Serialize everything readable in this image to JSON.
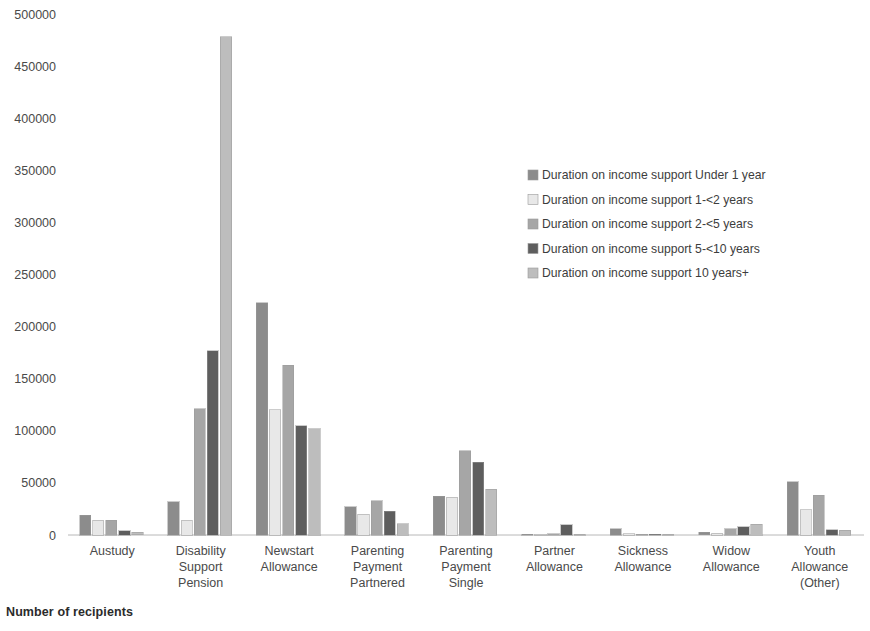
{
  "caption": "Number of recipients",
  "legend": {
    "position": "top-right",
    "items": [
      {
        "label": "Duration on income support Under 1 year",
        "color": "#8c8c8c"
      },
      {
        "label": "Duration on income support 1-<2 years",
        "color": "#e8e8e8"
      },
      {
        "label": "Duration on income support 2-<5 years",
        "color": "#a6a6a6"
      },
      {
        "label": "Duration on income support 5-<10 years",
        "color": "#5e5e5e"
      },
      {
        "label": "Duration on income support 10 years+",
        "color": "#bdbdbd"
      }
    ]
  },
  "chart_data": {
    "type": "bar",
    "title": "",
    "xlabel": "",
    "ylabel": "Number of recipients",
    "ylim": [
      0,
      500000
    ],
    "ytick_step": 50000,
    "yticks": [
      "0",
      "50000",
      "100000",
      "150000",
      "200000",
      "250000",
      "300000",
      "350000",
      "400000",
      "450000",
      "500000"
    ],
    "grid": false,
    "categories": [
      "Austudy",
      "Disability Support Pension",
      "Newstart Allowance",
      "Parenting Payment Partnered",
      "Parenting Payment Single",
      "Partner Allowance",
      "Sickness Allowance",
      "Widow Allowance",
      "Youth Allowance (Other)"
    ],
    "category_label_lines": [
      [
        "Austudy"
      ],
      [
        "Disability",
        "Support",
        "Pension"
      ],
      [
        "Newstart",
        "Allowance"
      ],
      [
        "Parenting",
        "Payment",
        "Partnered"
      ],
      [
        "Parenting",
        "Payment",
        "Single"
      ],
      [
        "Partner",
        "Allowance"
      ],
      [
        "Sickness",
        "Allowance"
      ],
      [
        "Widow",
        "Allowance"
      ],
      [
        "Youth",
        "Allowance",
        "(Other)"
      ]
    ],
    "series": [
      {
        "name": "Duration on income support Under 1 year",
        "color": "#8c8c8c",
        "values": [
          19000,
          32000,
          223000,
          27000,
          37000,
          200,
          6000,
          2500,
          51000
        ]
      },
      {
        "name": "Duration on income support 1-<2 years",
        "color": "#e8e8e8",
        "values": [
          14000,
          14000,
          120000,
          20000,
          36000,
          300,
          1000,
          1500,
          24000
        ]
      },
      {
        "name": "Duration on income support 2-<5 years",
        "color": "#a6a6a6",
        "values": [
          14000,
          121000,
          163000,
          33000,
          81000,
          1200,
          600,
          6000,
          38000
        ]
      },
      {
        "name": "Duration on income support 5-<10 years",
        "color": "#5e5e5e",
        "values": [
          4000,
          177000,
          105000,
          23000,
          70000,
          10000,
          300,
          8000,
          5000
        ]
      },
      {
        "name": "Duration on income support 10 years+",
        "color": "#bdbdbd",
        "values": [
          2500,
          478000,
          102000,
          11000,
          44000,
          700,
          200,
          10500,
          4500
        ]
      }
    ]
  }
}
